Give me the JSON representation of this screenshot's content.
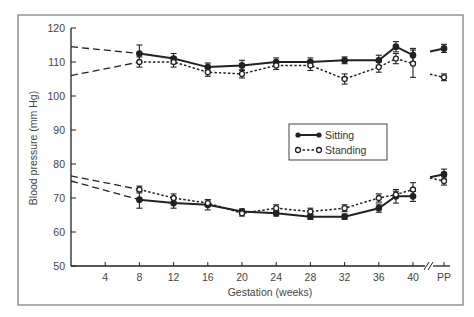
{
  "chart_data": {
    "type": "line",
    "title": "",
    "xlabel": "Gestation (weeks)",
    "ylabel": "Blood pressure (mm Hg)",
    "ylim": [
      50,
      120
    ],
    "yticks": [
      50,
      60,
      70,
      80,
      90,
      100,
      110,
      120
    ],
    "xticks": [
      {
        "label": "4",
        "pos": 4
      },
      {
        "label": "8",
        "pos": 8
      },
      {
        "label": "12",
        "pos": 12
      },
      {
        "label": "16",
        "pos": 16
      },
      {
        "label": "20",
        "pos": 20
      },
      {
        "label": "24",
        "pos": 24
      },
      {
        "label": "28",
        "pos": 28
      },
      {
        "label": "32",
        "pos": 32
      },
      {
        "label": "36",
        "pos": 36
      },
      {
        "label": "40",
        "pos": 40
      },
      {
        "label": "PP",
        "pos": 43
      }
    ],
    "grid": false,
    "axis_break_between": [
      "40",
      "PP"
    ],
    "legend": {
      "position": "center-right",
      "entries": [
        "Sitting",
        "Standing"
      ]
    },
    "x": [
      8,
      12,
      16,
      20,
      24,
      28,
      32,
      36,
      38,
      40,
      "PP"
    ],
    "series": [
      {
        "name": "Sitting",
        "group": "systolic",
        "style": "solid-filled",
        "values": [
          112.5,
          111,
          108.5,
          109,
          110,
          110,
          110.5,
          110.5,
          114.5,
          112,
          114
        ],
        "err": [
          2.5,
          1.5,
          1.2,
          1.5,
          1.2,
          1.2,
          1,
          1.5,
          1.5,
          2,
          1.2
        ],
        "extrapolated_start": 114.5
      },
      {
        "name": "Standing",
        "group": "systolic",
        "style": "dotted-open",
        "values": [
          110,
          110,
          107,
          106.5,
          109,
          109,
          105,
          108.5,
          111,
          109.5,
          105.5
        ],
        "err": [
          1.5,
          1.5,
          1.2,
          1.2,
          1.2,
          1.5,
          1.5,
          1.5,
          1.5,
          4,
          1
        ],
        "extrapolated_start": 106
      },
      {
        "name": "Sitting",
        "group": "diastolic",
        "style": "solid-filled",
        "values": [
          69.5,
          68.5,
          68,
          66,
          65.5,
          64.5,
          64.5,
          67,
          70.5,
          70.5,
          77
        ],
        "err": [
          2.5,
          1.5,
          1.5,
          0.8,
          0.8,
          0.8,
          0.8,
          1.2,
          2,
          1.5,
          1.5
        ],
        "extrapolated_start": 75
      },
      {
        "name": "Standing",
        "group": "diastolic",
        "style": "dotted-open",
        "values": [
          72.5,
          70,
          68.5,
          65.5,
          67,
          66,
          67,
          70,
          71,
          72.5,
          75
        ],
        "err": [
          1,
          1.2,
          1,
          0.8,
          1,
          1,
          1,
          1.2,
          1,
          2,
          1.2
        ],
        "extrapolated_start": 76.5
      }
    ]
  },
  "axis": {
    "x_title": "Gestation (weeks)",
    "y_title": "Blood pressure (mm Hg)"
  },
  "legend": {
    "sitting": "Sitting",
    "standing": "Standing"
  }
}
